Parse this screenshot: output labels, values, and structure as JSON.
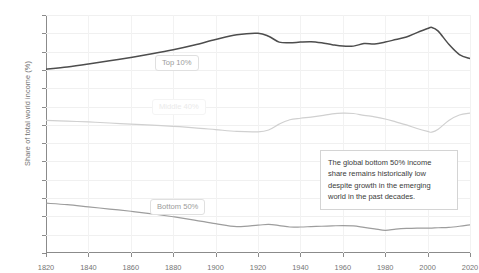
{
  "chart_data": {
    "type": "line",
    "title": "",
    "subtitle": "",
    "xlabel": "",
    "ylabel": "Share of total world income (%)",
    "xlim": [
      1820,
      2020
    ],
    "ylim": [
      0,
      65
    ],
    "grid": true,
    "legend_position": "inline-labels",
    "x_ticks": [
      "1820",
      "1840",
      "1860",
      "1880",
      "1900",
      "1920",
      "1940",
      "1960",
      "1980",
      "2000",
      "2020"
    ],
    "y_ticks": [
      "0%",
      "5%",
      "10%",
      "15%",
      "20%",
      "25%",
      "30%",
      "35%",
      "40%",
      "45%",
      "50%",
      "55%",
      "60%",
      "65%"
    ],
    "y_tick_values": [
      0,
      5,
      10,
      15,
      20,
      25,
      30,
      35,
      40,
      45,
      50,
      55,
      60,
      65
    ],
    "x_tick_values": [
      1820,
      1840,
      1860,
      1880,
      1900,
      1920,
      1940,
      1960,
      1980,
      2000,
      2020
    ],
    "series": [
      {
        "name": "Top 10%",
        "color": "#4d4d4d",
        "x": [
          1820,
          1830,
          1840,
          1850,
          1860,
          1870,
          1880,
          1890,
          1900,
          1910,
          1920,
          1925,
          1930,
          1935,
          1940,
          1945,
          1950,
          1955,
          1960,
          1965,
          1970,
          1975,
          1980,
          1985,
          1990,
          1995,
          2000,
          2002,
          2005,
          2010,
          2015,
          2020
        ],
        "values": [
          50.2,
          50.8,
          51.6,
          52.5,
          53.4,
          54.4,
          55.5,
          56.8,
          58.3,
          59.6,
          60.0,
          59.2,
          57.6,
          57.4,
          57.6,
          57.7,
          57.4,
          56.9,
          56.5,
          56.5,
          57.2,
          57.1,
          57.6,
          58.3,
          59.0,
          60.2,
          61.3,
          61.6,
          60.6,
          57.0,
          54.2,
          53.1
        ]
      },
      {
        "name": "Middle 40%",
        "color": "#d0d0d0",
        "x": [
          1820,
          1830,
          1840,
          1850,
          1860,
          1870,
          1880,
          1890,
          1900,
          1910,
          1920,
          1925,
          1930,
          1935,
          1940,
          1945,
          1950,
          1955,
          1960,
          1965,
          1970,
          1975,
          1980,
          1985,
          1990,
          1995,
          2000,
          2002,
          2005,
          2010,
          2015,
          2020
        ],
        "values": [
          36.2,
          36.0,
          35.8,
          35.5,
          35.2,
          34.9,
          34.6,
          34.2,
          33.7,
          33.2,
          33.1,
          33.6,
          35.2,
          36.4,
          36.8,
          37.1,
          37.5,
          38.0,
          38.2,
          38.1,
          37.6,
          37.2,
          36.6,
          35.8,
          35.0,
          34.0,
          33.2,
          33.0,
          33.8,
          36.2,
          37.7,
          38.2
        ]
      },
      {
        "name": "Bottom 50%",
        "color": "#9d9d9d",
        "x": [
          1820,
          1830,
          1840,
          1850,
          1860,
          1870,
          1880,
          1890,
          1900,
          1910,
          1920,
          1925,
          1930,
          1935,
          1940,
          1945,
          1950,
          1955,
          1960,
          1965,
          1970,
          1975,
          1980,
          1985,
          1990,
          1995,
          2000,
          2002,
          2005,
          2010,
          2015,
          2020
        ],
        "values": [
          13.6,
          13.2,
          12.6,
          12.0,
          11.4,
          10.7,
          9.9,
          9.0,
          8.0,
          7.2,
          7.6,
          7.8,
          7.5,
          7.1,
          7.1,
          7.2,
          7.3,
          7.4,
          7.5,
          7.4,
          7.0,
          6.6,
          6.2,
          6.5,
          6.7,
          6.8,
          6.8,
          6.8,
          6.9,
          7.0,
          7.3,
          7.7
        ]
      }
    ],
    "series_labels": [
      {
        "text": "Top 10%",
        "x_px": 155,
        "y_px": 55
      },
      {
        "text": "Middle 40%",
        "x_px": 152,
        "y_px": 99
      },
      {
        "text": "Bottom 50%",
        "x_px": 150,
        "y_px": 199
      }
    ],
    "annotations": [
      {
        "text": "The global bottom 50% income share remains historically low despite growth in the emerging world in the past decades.",
        "x_px": 320,
        "y_px": 150
      }
    ],
    "colors": {
      "top10": "#4d4d4d",
      "middle40": "#d0d0d0",
      "bottom50": "#9d9d9d",
      "grid": "#f0f0f0",
      "axis": "#8b8b8b",
      "text": "#757575",
      "annotation_text": "#3b3b3b"
    }
  }
}
